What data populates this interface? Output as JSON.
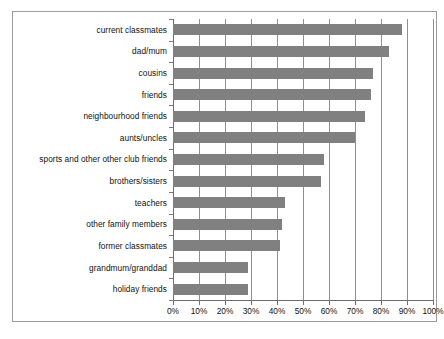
{
  "chart_data": {
    "type": "bar",
    "orientation": "horizontal",
    "title": "",
    "subtitle": "",
    "xlabel": "",
    "ylabel": "",
    "xlim": [
      0,
      100
    ],
    "xtick_step": 10,
    "grid": true,
    "legend": false,
    "bar_color": "#808080",
    "frame_color": "#9a9a9a",
    "gridline_color": "#8f8f8f",
    "axis_color": "#6f6f6f",
    "value_unit": "%",
    "categories": [
      "current classmates",
      "dad/mum",
      "cousins",
      "friends",
      "neighbourhood friends",
      "aunts/uncles",
      "sports and other other club friends",
      "brothers/sisters",
      "teachers",
      "other family members",
      "former classmates",
      "grandmum/granddad",
      "holiday friends"
    ],
    "values": [
      88,
      83,
      77,
      76,
      74,
      70,
      58,
      57,
      43,
      42,
      41,
      29,
      29
    ],
    "xticklabels": [
      "0%",
      "10%",
      "20%",
      "30%",
      "40%",
      "50%",
      "60%",
      "70%",
      "80%",
      "90%",
      "100%"
    ],
    "xtickvalues": [
      0,
      10,
      20,
      30,
      40,
      50,
      60,
      70,
      80,
      90,
      100
    ]
  }
}
